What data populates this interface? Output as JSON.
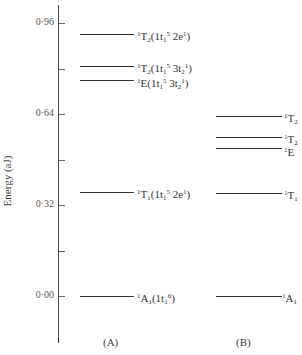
{
  "diagram": {
    "type": "energy-level-diagram",
    "y_axis": {
      "label": "Energy (aJ)",
      "ticks": [
        {
          "value": "0·96",
          "y": 23,
          "labeled": true
        },
        {
          "value": "0·80",
          "y": 69,
          "labeled": false
        },
        {
          "value": "0·64",
          "y": 114,
          "labeled": true
        },
        {
          "value": "0·48",
          "y": 160,
          "labeled": false
        },
        {
          "value": "0·32",
          "y": 205,
          "labeled": true
        },
        {
          "value": "0·16",
          "y": 251,
          "labeled": false
        },
        {
          "value": "0·00",
          "y": 296,
          "labeled": true
        }
      ]
    },
    "panels": [
      {
        "label": "(A)",
        "levels": [
          {
            "term": "1T2",
            "config": "1t1^5 2e^1",
            "energy": 0.92,
            "y": 34
          },
          {
            "term": "1T2",
            "config": "1t1^5 3t2^1",
            "energy": 0.85,
            "y": 66
          },
          {
            "term": "1E",
            "config": "1t1^5 3t2^1",
            "energy": 0.82,
            "y": 80
          },
          {
            "term": "1T1",
            "config": "1t1^5 2e^1",
            "energy": 0.35,
            "y": 192
          },
          {
            "term": "1A1",
            "config": "1t1^6",
            "energy": 0.0,
            "y": 296
          }
        ]
      },
      {
        "label": "(B)",
        "levels": [
          {
            "term": "1T2",
            "energy": 0.62,
            "y": 116
          },
          {
            "term": "1T2",
            "energy": 0.57,
            "y": 137
          },
          {
            "term": "1E",
            "energy": 0.55,
            "y": 148
          },
          {
            "term": "1T1",
            "energy": 0.35,
            "y": 193
          },
          {
            "term": "1A1",
            "energy": 0.0,
            "y": 296
          }
        ]
      }
    ]
  },
  "text": {
    "ylabel": "Energy (aJ)",
    "t096": "0·96",
    "t064": "0·64",
    "t032": "0·32",
    "t000": "0·00",
    "panelA": "(A)",
    "panelB": "(B)"
  }
}
